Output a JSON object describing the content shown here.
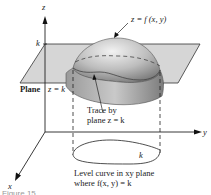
{
  "figure": {
    "axes": {
      "z_label": "z",
      "y_label": "y",
      "x_label": "x",
      "k_tick": "k"
    },
    "labels": {
      "surface": "z = f (x, y)",
      "plane": "Plane",
      "plane_eq": "z = k",
      "trace_line1": "Trace by",
      "trace_line2": "plane z = k",
      "level_k": "k",
      "level_line1": "Level curve in xy plane",
      "level_line2": "where f(x, y) = k",
      "fig_number": "Figure 15"
    },
    "colors": {
      "plane_fill": "#c8c8c8",
      "surface_light": "#e6e6e6",
      "surface_dark": "#8a8a8a",
      "line": "#222222"
    }
  }
}
